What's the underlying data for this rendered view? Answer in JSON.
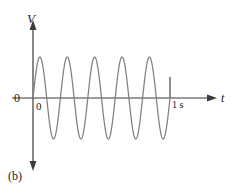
{
  "figure": {
    "panel_label": "(b)",
    "background_color": "#ffffff"
  },
  "axes": {
    "vertical": {
      "label": "V",
      "zero_label": "0",
      "color": "#3a3a3a",
      "arrow_top": true,
      "arrow_bottom": true
    },
    "horizontal": {
      "label": "t",
      "origin_label": "0",
      "tick_label": "1 s",
      "color": "#3a3a3a",
      "arrow_right": true
    }
  },
  "chart_data": {
    "type": "line",
    "title": "",
    "subtitle": "",
    "xlabel": "t",
    "ylabel": "V",
    "grid": false,
    "legend": null,
    "xlim": [
      0,
      1.18
    ],
    "ylim": [
      -1.25,
      1.25
    ],
    "xticks": [
      0,
      1
    ],
    "xticklabels": [
      "0",
      "1 s"
    ],
    "yticks": [
      0
    ],
    "yticklabels": [
      "0"
    ],
    "annotations": [
      "(b)"
    ],
    "series": [
      {
        "name": "voltage",
        "waveform": "sine",
        "amplitude": 1,
        "cycles_per_second": 5,
        "frequency_hz": 5,
        "period_s": 0.2,
        "phase": 0,
        "color": "#808080",
        "x": [
          0,
          0.02,
          0.04,
          0.06,
          0.08,
          0.1,
          0.12,
          0.14,
          0.16,
          0.18,
          0.2,
          0.22,
          0.24,
          0.26,
          0.28,
          0.3,
          0.32,
          0.34,
          0.36,
          0.38,
          0.4,
          0.42,
          0.44,
          0.46,
          0.48,
          0.5,
          0.52,
          0.54,
          0.56,
          0.58,
          0.6,
          0.62,
          0.64,
          0.66,
          0.68,
          0.7,
          0.72,
          0.74,
          0.76,
          0.78,
          0.8,
          0.82,
          0.84,
          0.86,
          0.88,
          0.9,
          0.92,
          0.94,
          0.96,
          0.98,
          1.0
        ],
        "values": [
          0,
          0.588,
          0.951,
          0.951,
          0.588,
          0,
          -0.588,
          -0.951,
          -0.951,
          -0.588,
          0,
          0.588,
          0.951,
          0.951,
          0.588,
          0,
          -0.588,
          -0.951,
          -0.951,
          -0.588,
          0,
          0.588,
          0.951,
          0.951,
          0.588,
          0,
          -0.588,
          -0.951,
          -0.951,
          -0.588,
          0,
          0.588,
          0.951,
          0.951,
          0.588,
          0,
          -0.588,
          -0.951,
          -0.951,
          -0.588,
          0,
          0.588,
          0.951,
          0.951,
          0.588,
          0,
          -0.588,
          -0.951,
          -0.951,
          -0.588,
          0
        ]
      }
    ]
  },
  "geometry": {
    "origin_x": 33,
    "origin_y": 98,
    "one_second_x": 170,
    "amplitude_px": 41,
    "axis_top_y": 26,
    "axis_bottom_y": 165,
    "axis_right_x": 215,
    "curve_color": "#808080",
    "axis_color": "#3a3a3a"
  }
}
